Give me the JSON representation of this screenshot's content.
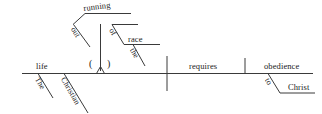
{
  "diagram": {
    "type": "reed-kellogg-sentence-diagram",
    "sentence": "The Christian life requires obedience to Christ",
    "line_color": "#3a3a3a",
    "text_color": "#1a1a1a",
    "background_color": "#ffffff",
    "baseline": {
      "subject": "life",
      "verb": "requires",
      "direct_object": "obedience"
    },
    "modifiers": {
      "subject_mod_1": "The",
      "subject_mod_2": "Christian",
      "object_prep": "to",
      "object_prep_object": "Christ"
    },
    "gerund_phrase": {
      "gerund": "running",
      "gerund_mod": "out",
      "prep": "of",
      "prep_object": "race",
      "prep_object_mod": "the",
      "placeholder_open_paren": "(",
      "placeholder_close_paren": ")",
      "placeholder_symbol": "caret-mark"
    }
  }
}
